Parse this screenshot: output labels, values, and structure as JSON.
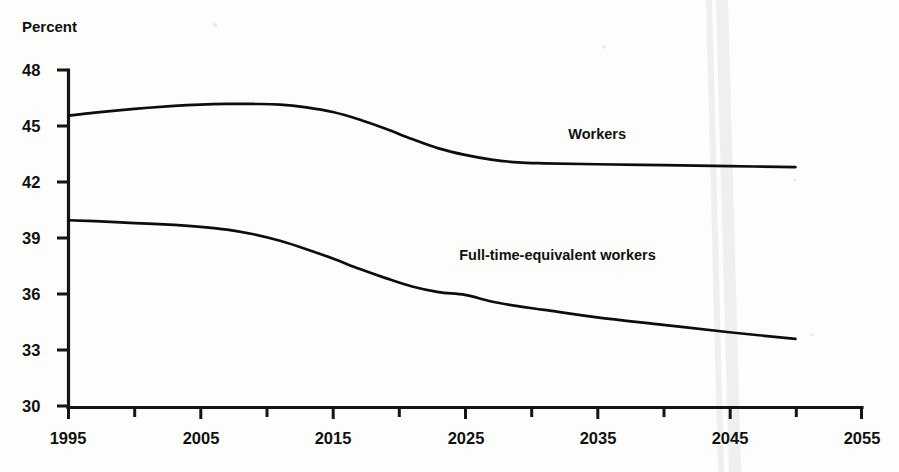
{
  "chart_data": {
    "type": "line",
    "title": "",
    "subtitle": "",
    "xlabel": "",
    "ylabel": "Percent",
    "xlim": [
      1995,
      2055
    ],
    "ylim": [
      30,
      48
    ],
    "grid": false,
    "legend_position": "inline-annotation",
    "y_ticks": [
      30,
      33,
      36,
      39,
      42,
      45,
      48
    ],
    "y_tick_labels": [
      "30",
      "33",
      "36",
      "39",
      "42",
      "45",
      "48"
    ],
    "x_ticks": [
      1995,
      2000,
      2005,
      2010,
      2015,
      2020,
      2025,
      2030,
      2035,
      2040,
      2045,
      2050,
      2055
    ],
    "x_tick_labels": [
      "1995",
      "",
      "2005",
      "",
      "2015",
      "",
      "2025",
      "",
      "2035",
      "",
      "2045",
      "",
      "2055"
    ],
    "x_major_labels": [
      "1995",
      "2005",
      "2015",
      "2025",
      "2035",
      "2045",
      "2055"
    ],
    "x_major_values": [
      1995,
      2005,
      2015,
      2025,
      2035,
      2045,
      2055
    ],
    "series": [
      {
        "name": "Workers",
        "label": "Workers",
        "label_at": {
          "x": 2035,
          "y": 44.3
        },
        "x": [
          1995,
          1997,
          2000,
          2003,
          2005,
          2007,
          2009,
          2011,
          2013,
          2015,
          2017,
          2019,
          2021,
          2023,
          2025,
          2027,
          2029,
          2031,
          2035,
          2040,
          2045,
          2050
        ],
        "values": [
          45.55,
          45.72,
          45.92,
          46.08,
          46.15,
          46.18,
          46.18,
          46.15,
          46.0,
          45.75,
          45.35,
          44.85,
          44.3,
          43.8,
          43.45,
          43.2,
          43.05,
          43.0,
          42.95,
          42.9,
          42.85,
          42.8
        ]
      },
      {
        "name": "Full-time-equivalent workers",
        "label": "Full-time-equivalent workers",
        "label_at": {
          "x": 2032,
          "y": 37.8
        },
        "x": [
          1995,
          1997,
          2000,
          2003,
          2005,
          2007,
          2009,
          2011,
          2013,
          2015,
          2017,
          2019,
          2021,
          2023,
          2025,
          2027,
          2029,
          2031,
          2035,
          2040,
          2045,
          2050
        ],
        "values": [
          39.95,
          39.9,
          39.8,
          39.7,
          39.6,
          39.45,
          39.2,
          38.85,
          38.4,
          37.9,
          37.35,
          36.85,
          36.4,
          36.1,
          35.95,
          35.6,
          35.35,
          35.15,
          34.75,
          34.35,
          33.95,
          33.6
        ]
      }
    ]
  },
  "axis": {
    "y_title": "Percent"
  },
  "annotations": {
    "workers": "Workers",
    "fte_workers": "Full-time-equivalent workers"
  },
  "colors": {
    "line": "#0d0d0d",
    "axis": "#151515",
    "background": "#fdfdfc",
    "crease": "#ececeb"
  }
}
